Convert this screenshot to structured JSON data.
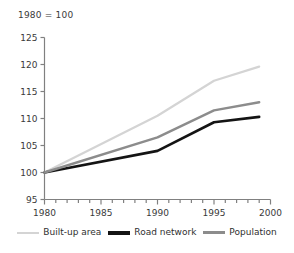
{
  "chart_data": {
    "type": "line",
    "title": "1980 = 100",
    "xlabel": "",
    "ylabel": "",
    "xlim": [
      1980,
      2000
    ],
    "ylim": [
      95,
      125
    ],
    "yticks": [
      95,
      100,
      105,
      110,
      115,
      120,
      125
    ],
    "xticks": [
      1980,
      1985,
      1990,
      1995,
      2000
    ],
    "xtick_labels": [
      "1980",
      "1985",
      "1990",
      "1995",
      "2000"
    ],
    "ytick_labels": [
      "95",
      "100",
      "105",
      "110",
      "115",
      "120",
      "125"
    ],
    "x_minor_tick_step": 1,
    "grid": false,
    "legend_position": "bottom",
    "x": [
      1980,
      1990,
      1995,
      1999
    ],
    "series": [
      {
        "name": "Built-up area",
        "color": "#d4d4d4",
        "width": 2.2,
        "values": [
          100,
          110.5,
          117.0,
          119.6
        ]
      },
      {
        "name": "Road network",
        "color": "#141414",
        "width": 2.6,
        "values": [
          100,
          104.0,
          109.3,
          110.3
        ]
      },
      {
        "name": "Population",
        "color": "#8c8c8c",
        "width": 2.4,
        "values": [
          100,
          106.5,
          111.5,
          113.0
        ]
      }
    ]
  },
  "legend": {
    "entries": [
      {
        "label": "Built-up area",
        "color": "#d4d4d4",
        "width": 2
      },
      {
        "label": "Road network",
        "color": "#141414",
        "width": 4
      },
      {
        "label": "Population",
        "color": "#8c8c8c",
        "width": 3
      }
    ]
  },
  "axis": {
    "color": "#808080"
  }
}
